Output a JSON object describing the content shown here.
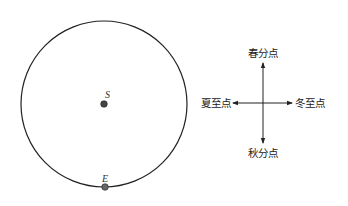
{
  "diagram": {
    "orbit": {
      "center_label": "S",
      "point_label": "E",
      "stroke_color": "#222222",
      "point_color": "#444444"
    },
    "compass": {
      "top": "春分点",
      "bottom": "秋分点",
      "left": "夏至点",
      "right": "冬至点"
    }
  }
}
